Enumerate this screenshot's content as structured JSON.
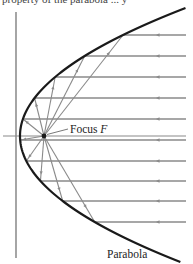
{
  "caption_fragment": "property of the parabola ... y",
  "labels": {
    "focus_prefix": "Focus ",
    "focus_symbol": "F",
    "parabola": "Parabola"
  },
  "colors": {
    "curve": "#1a1a1a",
    "ray": "#8a8a8a",
    "axis": "#6a6a6a",
    "text": "#222222"
  },
  "geometry": {
    "vertex": [
      20,
      136
    ],
    "focus": [
      44,
      136
    ],
    "a": 0.0101,
    "directrix_x": 16,
    "directrix_y": [
      12,
      258
    ],
    "axis_y": 136,
    "axis_x": [
      3,
      186
    ],
    "ray_right_x": 186,
    "arrow_x": 158,
    "ray_ys": [
      35,
      56,
      77,
      98,
      119,
      140,
      161,
      181,
      201,
      222
    ]
  }
}
